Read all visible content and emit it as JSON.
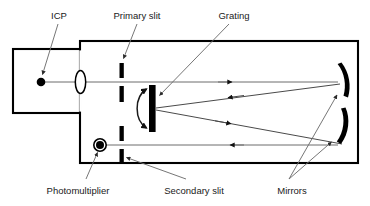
{
  "figure": {
    "type": "schematic-diagram",
    "background_color": "#ffffff",
    "line_color": "#000000",
    "beam_color": "#6d6d6d",
    "leader_color": "#6f6f6f",
    "width": 370,
    "height": 206
  },
  "labels": {
    "icp": "ICP",
    "primary_slit": "Primary slit",
    "grating": "Grating",
    "photomultiplier": "Photomultiplier",
    "secondary_slit": "Secondary slit",
    "mirrors": "Mirrors"
  },
  "components": [
    {
      "name": "icp-source",
      "label": "ICP",
      "shape": "filled-circle",
      "position": "left-chamber"
    },
    {
      "name": "lens",
      "label": "",
      "shape": "ellipse",
      "position": "chamber-exit"
    },
    {
      "name": "primary-slit",
      "label": "Primary slit",
      "shape": "slit-pair",
      "position": "upper-left"
    },
    {
      "name": "grating",
      "label": "Grating",
      "shape": "thick-bar-rotatable",
      "position": "center"
    },
    {
      "name": "photomultiplier",
      "label": "Photomultiplier",
      "shape": "ring-with-dot",
      "position": "lower-left"
    },
    {
      "name": "secondary-slit",
      "label": "Secondary slit",
      "shape": "slit-pair",
      "position": "lower-left"
    },
    {
      "name": "mirror-top",
      "label": "Mirrors",
      "shape": "curved-arc",
      "position": "right-upper"
    },
    {
      "name": "mirror-bottom",
      "label": "Mirrors",
      "shape": "curved-arc",
      "position": "right-lower"
    }
  ],
  "beam_path": [
    {
      "name": "beam-source-to-mirror-top",
      "direction": "right",
      "from": "icp-source",
      "to": "mirror-top"
    },
    {
      "name": "beam-mirror-top-to-grating",
      "direction": "left",
      "from": "mirror-top",
      "to": "grating"
    },
    {
      "name": "beam-grating-to-mirror-bottom",
      "direction": "right",
      "from": "grating",
      "to": "mirror-bottom"
    },
    {
      "name": "beam-mirror-bottom-to-detector",
      "direction": "left",
      "from": "mirror-bottom",
      "to": "photomultiplier"
    }
  ]
}
